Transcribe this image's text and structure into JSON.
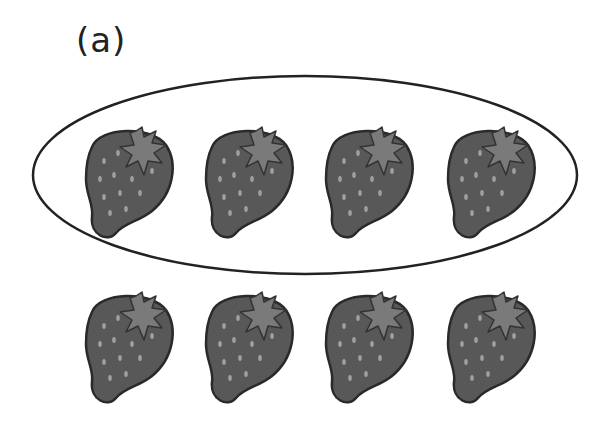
{
  "label": "(a)",
  "colors": {
    "berry_fill": "#585858",
    "berry_stroke": "#2a2a2a",
    "leaf_fill": "#7a7a7a",
    "seed": "#9a9a9a",
    "ellipse_stroke": "#222222"
  },
  "groups": [
    {
      "name": "circled-group",
      "count": 4,
      "circled": true
    },
    {
      "name": "bottom-row",
      "count": 4,
      "circled": false
    }
  ],
  "strawberries": [
    {
      "x": 130,
      "y": 175
    },
    {
      "x": 250,
      "y": 175
    },
    {
      "x": 370,
      "y": 175
    },
    {
      "x": 492,
      "y": 175
    },
    {
      "x": 130,
      "y": 340
    },
    {
      "x": 250,
      "y": 340
    },
    {
      "x": 370,
      "y": 340
    },
    {
      "x": 492,
      "y": 340
    }
  ]
}
